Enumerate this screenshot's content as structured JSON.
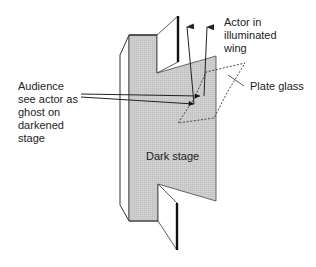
{
  "diagram": {
    "labels": {
      "audience": "Audience\nsee actor as\nghost on\ndarkened\nstage",
      "actor": "Actor in\nilluminated\nwing",
      "plate_glass": "Plate glass",
      "dark_stage": "Dark stage"
    },
    "colors": {
      "stage_fill": "#c8c8c8",
      "line": "#222222",
      "wing_fill": "#ffffff",
      "background": "#ffffff"
    },
    "elements": [
      {
        "id": "dark-stage",
        "type": "shaded-polygon"
      },
      {
        "id": "side-panel",
        "type": "outline-polygon"
      },
      {
        "id": "upper-wing",
        "type": "outline-polygon"
      },
      {
        "id": "lower-wing",
        "type": "outline-polygon"
      },
      {
        "id": "plate-glass",
        "type": "dashed-polygon"
      },
      {
        "id": "audience-rays",
        "type": "lines",
        "count": 2
      },
      {
        "id": "actor-rays",
        "type": "arrows",
        "count": 2
      }
    ]
  }
}
